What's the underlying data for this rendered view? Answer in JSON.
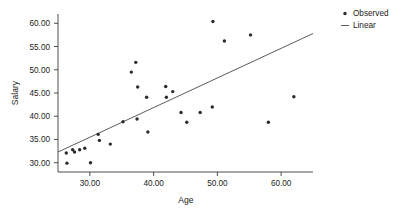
{
  "chart_data": {
    "type": "scatter",
    "title": "",
    "subtitle": "",
    "xlabel": "Age",
    "ylabel": "Salary",
    "xlim": [
      25.0,
      65.0
    ],
    "ylim": [
      28.0,
      62.0
    ],
    "grid": false,
    "legend_position": "right",
    "x_ticks": [
      30.0,
      40.0,
      50.0,
      60.0
    ],
    "x_tick_labels": [
      "30.00",
      "40.00",
      "50.00",
      "60.00"
    ],
    "y_ticks": [
      30.0,
      35.0,
      40.0,
      45.0,
      50.0,
      55.0,
      60.0
    ],
    "y_tick_labels": [
      "30.00",
      "35.00",
      "40.00",
      "45.00",
      "50.00",
      "55.00",
      "60.00"
    ],
    "legend": [
      {
        "label": "Observed",
        "marker": "dot",
        "color": "#2b2b2b"
      },
      {
        "label": "Linear",
        "marker": "line",
        "color": "#4a4a4a"
      }
    ],
    "series": [
      {
        "name": "Observed",
        "marker": "dot",
        "color": "#2b2b2b",
        "points": [
          [
            26.3,
            32.1
          ],
          [
            26.4,
            29.9
          ],
          [
            27.3,
            32.8
          ],
          [
            27.6,
            32.3
          ],
          [
            28.4,
            32.8
          ],
          [
            29.2,
            33.1
          ],
          [
            30.1,
            30.0
          ],
          [
            31.3,
            36.1
          ],
          [
            31.5,
            34.8
          ],
          [
            33.2,
            34.0
          ],
          [
            35.2,
            38.8
          ],
          [
            36.5,
            49.5
          ],
          [
            37.2,
            51.6
          ],
          [
            37.4,
            39.4
          ],
          [
            37.5,
            46.3
          ],
          [
            38.9,
            44.1
          ],
          [
            39.1,
            36.6
          ],
          [
            41.9,
            46.4
          ],
          [
            42.0,
            44.1
          ],
          [
            43.0,
            45.3
          ],
          [
            44.3,
            40.8
          ],
          [
            45.2,
            38.7
          ],
          [
            47.3,
            40.8
          ],
          [
            49.2,
            42.0
          ],
          [
            49.3,
            60.4
          ],
          [
            51.1,
            56.2
          ],
          [
            55.2,
            57.5
          ],
          [
            58.0,
            38.7
          ],
          [
            62.0,
            44.2
          ]
        ]
      },
      {
        "name": "Linear",
        "marker": "line",
        "color": "#4a4a4a",
        "line_from": [
          25.0,
          32.3
        ],
        "line_to": [
          65.0,
          57.8
        ]
      }
    ]
  },
  "axes": {
    "x_title": "Age",
    "y_title": "Salary"
  }
}
